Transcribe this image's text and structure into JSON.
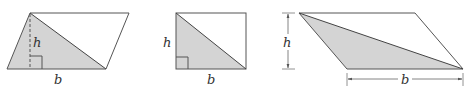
{
  "figure": {
    "colors": {
      "stroke": "#555555",
      "fill": "#d4d4d4",
      "text": "#333333"
    },
    "panels": [
      {
        "id": "parallelogram-1",
        "h_label": "h",
        "b_label": "b"
      },
      {
        "id": "rectangle",
        "h_label": "h",
        "b_label": "b"
      },
      {
        "id": "parallelogram-2",
        "h_label": "h",
        "b_label": "b"
      }
    ]
  }
}
